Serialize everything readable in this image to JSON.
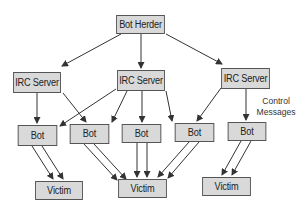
{
  "diagram": {
    "type": "botnet-hierarchy",
    "nodes": {
      "herder": {
        "label": "Bot Herder"
      },
      "irc": [
        {
          "label": "IRC Server"
        },
        {
          "label": "IRC Server"
        },
        {
          "label": "IRC Server"
        }
      ],
      "bots": [
        {
          "label": "Bot"
        },
        {
          "label": "Bot"
        },
        {
          "label": "Bot"
        },
        {
          "label": "Bot"
        },
        {
          "label": "Bot"
        }
      ],
      "victims": [
        {
          "label": "Victim"
        },
        {
          "label": "Victim"
        },
        {
          "label": "Victim"
        }
      ]
    },
    "annotation": {
      "line1": "Control",
      "line2": "Messages"
    },
    "edges": [
      [
        "Bot Herder",
        "IRC Server 1"
      ],
      [
        "Bot Herder",
        "IRC Server 2"
      ],
      [
        "Bot Herder",
        "IRC Server 3"
      ],
      [
        "IRC Server 1",
        "Bot 1"
      ],
      [
        "IRC Server 1",
        "Bot 2"
      ],
      [
        "IRC Server 2",
        "Bot 1"
      ],
      [
        "IRC Server 2",
        "Bot 2"
      ],
      [
        "IRC Server 2",
        "Bot 3"
      ],
      [
        "IRC Server 2",
        "Bot 4"
      ],
      [
        "IRC Server 3",
        "Bot 4"
      ],
      [
        "IRC Server 3",
        "Bot 5"
      ],
      [
        "Bot 1",
        "Victim 1",
        "x2"
      ],
      [
        "Bot 2",
        "Victim 2",
        "x2"
      ],
      [
        "Bot 3",
        "Victim 2",
        "x2"
      ],
      [
        "Bot 4",
        "Victim 2",
        "x2"
      ],
      [
        "Bot 5",
        "Victim 3",
        "x2"
      ]
    ],
    "colors": {
      "box_fill": "#d9d9d9",
      "box_border": "#555555",
      "arrow": "#333333"
    }
  }
}
